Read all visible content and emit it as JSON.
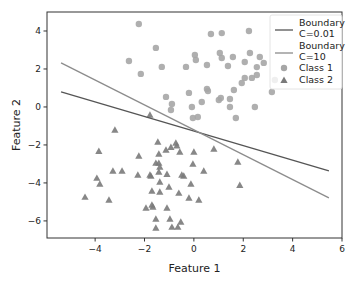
{
  "chart_data": {
    "type": "scatter",
    "title": "",
    "xlabel": "Feature 1",
    "ylabel": "Feature 2",
    "xlim": [
      -5.95,
      6.0
    ],
    "ylim": [
      -6.9,
      5.0
    ],
    "xticks": [
      -4,
      -2,
      0,
      2,
      4,
      6
    ],
    "xtick_labels": [
      "−4",
      "−2",
      "0",
      "2",
      "4",
      "6"
    ],
    "yticks": [
      -6,
      -4,
      -2,
      0,
      2,
      4
    ],
    "ytick_labels": [
      "−6",
      "−4",
      "−2",
      "0",
      "2",
      "4"
    ],
    "grid": false,
    "legend_position": "top-right",
    "lines": [
      {
        "name": "Boundary C=0.01",
        "label_lines": [
          "Boundary",
          "C=0.01"
        ],
        "color": "#555555",
        "x": [
          -5.38,
          5.47
        ],
        "y": [
          0.79,
          -3.37
        ]
      },
      {
        "name": "Boundary C=10",
        "label_lines": [
          "Boundary",
          "C=10"
        ],
        "color": "#8c8c8c",
        "x": [
          -5.38,
          5.47
        ],
        "y": [
          2.32,
          -4.79
        ]
      }
    ],
    "series": [
      {
        "name": "Class 1",
        "marker": "circle",
        "color": "#a6a6a6",
        "points": [
          [
            -2.23,
            4.37
          ],
          [
            0.69,
            3.84
          ],
          [
            1.13,
            3.89
          ],
          [
            2.23,
            4.0
          ],
          [
            -1.54,
            3.11
          ],
          [
            -2.63,
            2.42
          ],
          [
            0.04,
            2.74
          ],
          [
            0.08,
            2.47
          ],
          [
            -1.3,
            2.11
          ],
          [
            -0.32,
            2.11
          ],
          [
            0.53,
            2.21
          ],
          [
            -2.15,
            1.74
          ],
          [
            1.05,
            2.84
          ],
          [
            1.13,
            2.58
          ],
          [
            1.58,
            2.63
          ],
          [
            1.38,
            2.16
          ],
          [
            2.06,
            2.37
          ],
          [
            2.27,
            2.84
          ],
          [
            2.67,
            2.63
          ],
          [
            2.83,
            2.32
          ],
          [
            1.94,
            1.26
          ],
          [
            2.06,
            1.53
          ],
          [
            2.35,
            1.53
          ],
          [
            2.55,
            1.68
          ],
          [
            2.55,
            2.1
          ],
          [
            3.28,
            1.42
          ],
          [
            3.16,
            0.79
          ],
          [
            2.47,
            0.0
          ],
          [
            -1.13,
            0.53
          ],
          [
            -0.89,
            0.16
          ],
          [
            -0.93,
            -0.16
          ],
          [
            -0.2,
            0.74
          ],
          [
            -0.08,
            0.0
          ],
          [
            -0.04,
            -0.58
          ],
          [
            0.16,
            -0.53
          ],
          [
            0.32,
            0.26
          ],
          [
            0.53,
            0.95
          ],
          [
            0.57,
            0.84
          ],
          [
            1.01,
            0.37
          ],
          [
            1.09,
            0.47
          ],
          [
            1.46,
            0.42
          ],
          [
            1.46,
            0.0
          ],
          [
            1.62,
            0.89
          ],
          [
            1.7,
            -0.58
          ]
        ]
      },
      {
        "name": "Class 2",
        "marker": "triangle",
        "color": "#7a7a7a",
        "points": [
          [
            -1.78,
            -0.42
          ],
          [
            -3.2,
            -1.21
          ],
          [
            -3.85,
            -2.32
          ],
          [
            -2.23,
            -2.58
          ],
          [
            -3.28,
            -3.37
          ],
          [
            -2.91,
            -3.37
          ],
          [
            -3.93,
            -3.74
          ],
          [
            -3.81,
            -4.05
          ],
          [
            -4.41,
            -4.74
          ],
          [
            -3.44,
            -4.89
          ],
          [
            -2.27,
            -3.58
          ],
          [
            -1.78,
            -3.58
          ],
          [
            -1.46,
            -1.84
          ],
          [
            -1.42,
            -2.47
          ],
          [
            -1.13,
            -2.26
          ],
          [
            -0.93,
            -2.11
          ],
          [
            -0.73,
            -1.89
          ],
          [
            -0.69,
            -2.03
          ],
          [
            -0.57,
            -2.37
          ],
          [
            0.0,
            -2.37
          ],
          [
            0.81,
            -2.21
          ],
          [
            1.78,
            -2.89
          ],
          [
            -1.54,
            -2.95
          ],
          [
            -1.42,
            -2.95
          ],
          [
            -1.38,
            -3.16
          ],
          [
            -1.74,
            -3.63
          ],
          [
            -1.42,
            -3.42
          ],
          [
            -1.09,
            -3.53
          ],
          [
            -0.49,
            -3.58
          ],
          [
            -0.41,
            -3.63
          ],
          [
            -0.04,
            -3.0
          ],
          [
            0.4,
            -3.37
          ],
          [
            -1.38,
            -3.95
          ],
          [
            -1.01,
            -4.21
          ],
          [
            -1.7,
            -4.42
          ],
          [
            -1.38,
            -4.47
          ],
          [
            -0.61,
            -4.53
          ],
          [
            -0.2,
            -4.79
          ],
          [
            0.2,
            -4.89
          ],
          [
            -0.12,
            -4.05
          ],
          [
            1.86,
            -4.11
          ],
          [
            -1.94,
            -5.31
          ],
          [
            -1.7,
            -5.16
          ],
          [
            -1.66,
            -5.26
          ],
          [
            -1.09,
            -5.31
          ],
          [
            -1.54,
            -5.89
          ],
          [
            -0.97,
            -5.89
          ],
          [
            -0.53,
            -6.05
          ],
          [
            -0.89,
            -6.32
          ],
          [
            -0.65,
            -6.32
          ],
          [
            -1.54,
            -6.37
          ]
        ]
      }
    ]
  }
}
